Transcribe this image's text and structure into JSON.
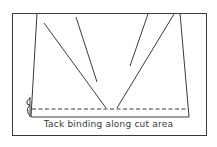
{
  "diagram": {
    "caption": "Tack binding along cut area",
    "line_color": "#3a3a3a",
    "background": "#ffffff",
    "elements": [
      "outer-frame",
      "garment-panel-trapezoid",
      "fold-lines",
      "dashed-tack-line",
      "binding-clip"
    ]
  }
}
